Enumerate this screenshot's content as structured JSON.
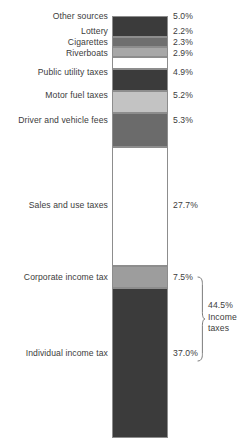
{
  "chart_data": {
    "type": "bar",
    "subtype": "stacked-bar-single-column",
    "title": "",
    "xlabel": "",
    "ylabel": "",
    "ylim": [
      0,
      100
    ],
    "grid": false,
    "legend": "none",
    "units": "percent of total revenue",
    "categories": [
      "Other sources",
      "Lottery",
      "Cigarettes",
      "Riverboats",
      "Public utility taxes",
      "Motor fuel taxes",
      "Driver and vehicle fees",
      "Sales and use taxes",
      "Corporate income tax",
      "Individual income tax"
    ],
    "values": [
      5.0,
      2.2,
      2.3,
      2.9,
      4.9,
      5.2,
      5.3,
      27.7,
      7.5,
      37.0
    ],
    "value_labels": [
      "5.0%",
      "2.2%",
      "2.3%",
      "2.9%",
      "4.9%",
      "5.2%",
      "5.3%",
      "27.7%",
      "7.5%",
      "37.0%"
    ],
    "segment_colors": [
      "#3b3b3b",
      "#6f6f6f",
      "#a8a8a8",
      "#ffffff",
      "#3b3b3b",
      "#c3c3c3",
      "#6b6b6b",
      "#ffffff",
      "#9d9d9d",
      "#3b3b3b"
    ],
    "annotations": [
      {
        "name": "income-taxes-bracket",
        "value": "44.5%",
        "lines": [
          "44.5%",
          "Income",
          "taxes"
        ],
        "covers": [
          "Corporate income tax",
          "Individual income tax"
        ]
      }
    ],
    "stroke_color": "#8d8d8d",
    "text_color": "#3c3c3c"
  },
  "segments": [
    {
      "label": "Other sources",
      "value": "5.0%",
      "top": 0,
      "height": 21,
      "color": "#3b3b3b",
      "label_y": 16,
      "value_y": 16
    },
    {
      "label": "Lottery",
      "value": "2.2%",
      "top": 21,
      "height": 10,
      "color": "#6f6f6f",
      "label_y": 31,
      "value_y": 31
    },
    {
      "label": "Cigarettes",
      "value": "2.3%",
      "top": 31,
      "height": 10,
      "color": "#a8a8a8",
      "label_y": 42,
      "value_y": 42
    },
    {
      "label": "Riverboats",
      "value": "2.9%",
      "top": 41,
      "height": 12,
      "color": "#ffffff",
      "label_y": 53,
      "value_y": 53
    },
    {
      "label": "Public utility taxes",
      "value": "4.9%",
      "top": 53,
      "height": 22,
      "color": "#3b3b3b",
      "label_y": 72,
      "value_y": 72
    },
    {
      "label": "Motor fuel taxes",
      "value": "5.2%",
      "top": 75,
      "height": 22,
      "color": "#c3c3c3",
      "label_y": 95,
      "value_y": 95
    },
    {
      "label": "Driver and vehicle fees",
      "value": "5.3%",
      "top": 97,
      "height": 34,
      "color": "#6b6b6b",
      "label_y": 120,
      "value_y": 120
    },
    {
      "label": "Sales and use taxes",
      "value": "27.7%",
      "top": 131,
      "height": 119,
      "color": "#ffffff",
      "label_y": 205,
      "value_y": 205
    },
    {
      "label": "Corporate income tax",
      "value": "7.5%",
      "top": 250,
      "height": 22,
      "color": "#9d9d9d",
      "label_y": 277,
      "value_y": 277
    },
    {
      "label": "Individual income tax",
      "value": "37.0%",
      "top": 272,
      "height": 150,
      "color": "#3b3b3b",
      "label_y": 353,
      "value_y": 353
    }
  ],
  "bracket": {
    "lines": [
      "44.5%",
      "Income",
      "taxes"
    ]
  }
}
